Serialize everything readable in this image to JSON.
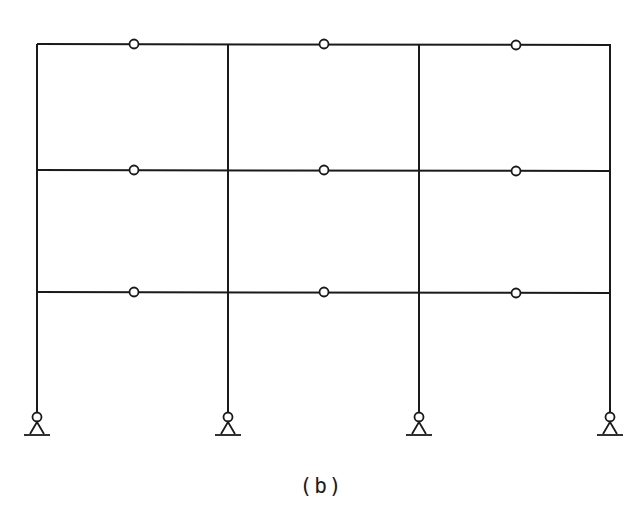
{
  "diagram": {
    "type": "structural-frame",
    "caption": "(b)",
    "stroke_color": "#1a1a1a",
    "columns_x": [
      37,
      228,
      419,
      610
    ],
    "beam_levels_y": [
      44,
      170,
      292
    ],
    "column_base_y": 412,
    "hinges": [
      {
        "x": 134,
        "y": 44
      },
      {
        "x": 324,
        "y": 44
      },
      {
        "x": 516,
        "y": 45
      },
      {
        "x": 134,
        "y": 170
      },
      {
        "x": 324,
        "y": 170
      },
      {
        "x": 516,
        "y": 171
      },
      {
        "x": 134,
        "y": 292
      },
      {
        "x": 324,
        "y": 292
      },
      {
        "x": 516,
        "y": 293
      }
    ],
    "supports": [
      {
        "type": "pin",
        "x": 37
      },
      {
        "type": "pin",
        "x": 228
      },
      {
        "type": "pin",
        "x": 419
      },
      {
        "type": "pin",
        "x": 610
      }
    ]
  }
}
